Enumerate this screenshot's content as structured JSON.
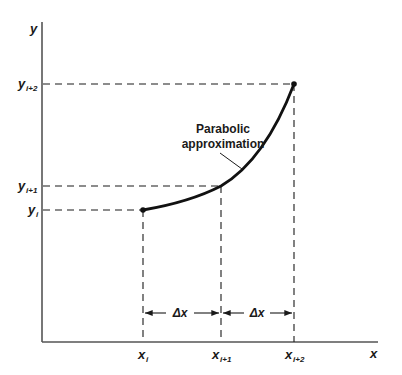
{
  "diagram": {
    "title": "Parabolic approximation",
    "axes": {
      "x_label": "x",
      "y_label": "y"
    },
    "y_ticks": [
      {
        "main": "y",
        "sub": "i+2"
      },
      {
        "main": "y",
        "sub": "i+1"
      },
      {
        "main": "y",
        "sub": "i"
      }
    ],
    "x_ticks": [
      {
        "main": "x",
        "sub": "i"
      },
      {
        "main": "x",
        "sub": "i+1"
      },
      {
        "main": "x",
        "sub": "i+2"
      }
    ],
    "intervals": [
      {
        "label": "Δx"
      },
      {
        "label": "Δx"
      }
    ],
    "annotation": {
      "line1": "Parabolic",
      "line2": "approximation"
    },
    "colors": {
      "ink": "#1a1a1a",
      "axis": "#555555",
      "background": "#ffffff"
    }
  }
}
